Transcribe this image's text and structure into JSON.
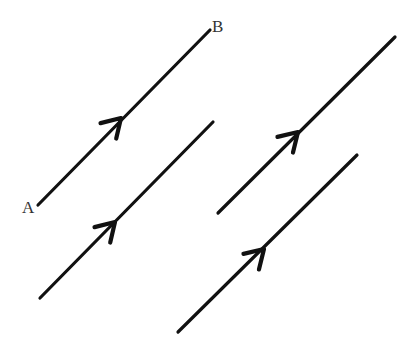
{
  "diagram": {
    "labels": [
      {
        "id": "A",
        "text": "A",
        "x": 22,
        "y": 213
      },
      {
        "id": "B",
        "text": "B",
        "x": 212,
        "y": 32
      }
    ],
    "lines": [
      {
        "id": "AB",
        "x1": 38,
        "y1": 205,
        "x2": 210,
        "y2": 30,
        "arrow_at": [
          121,
          118
        ]
      },
      {
        "id": "line-2",
        "x1": 40,
        "y1": 298,
        "x2": 213,
        "y2": 122,
        "arrow_at": [
          115,
          222
        ]
      },
      {
        "id": "line-3",
        "x1": 218,
        "y1": 213,
        "x2": 395,
        "y2": 37,
        "arrow_at": [
          298,
          132
        ]
      },
      {
        "id": "line-4",
        "x1": 178,
        "y1": 332,
        "x2": 357,
        "y2": 155,
        "arrow_at": [
          264,
          249
        ]
      }
    ],
    "colors": {
      "stroke": "#111111",
      "label": "#333333",
      "background": "#ffffff"
    }
  }
}
